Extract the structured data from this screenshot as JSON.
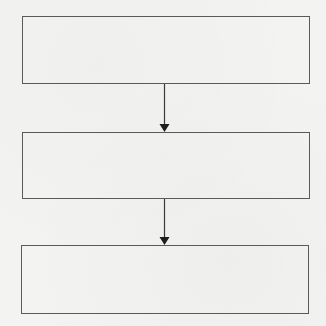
{
  "diagram": {
    "type": "flowchart",
    "direction": "top-to-bottom",
    "nodes": [
      {
        "id": "box-1",
        "label": ""
      },
      {
        "id": "box-2",
        "label": ""
      },
      {
        "id": "box-3",
        "label": ""
      }
    ],
    "edges": [
      {
        "from": "box-1",
        "to": "box-2",
        "label": ""
      },
      {
        "from": "box-2",
        "to": "box-3",
        "label": ""
      }
    ],
    "colors": {
      "stroke": "#4a4a4a",
      "background": "#f3f3f1"
    }
  }
}
